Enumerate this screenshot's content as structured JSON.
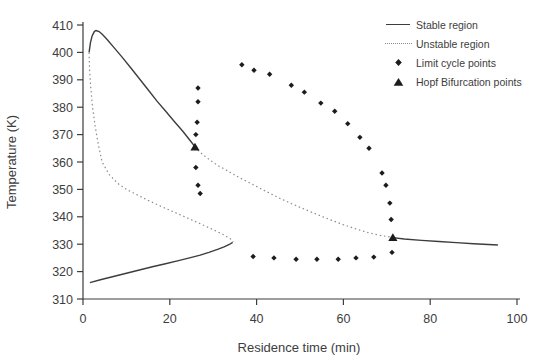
{
  "figure": {
    "background": "#ffffff",
    "ink_color": "#3d3d3d",
    "unstable_color": "#8c8c8c",
    "marker_color": "#1c1c1c"
  },
  "chart_data": {
    "type": "line",
    "title": "",
    "xlabel": "Residence time (min)",
    "ylabel": "Temperature (K)",
    "xlim": [
      0,
      100
    ],
    "ylim": [
      310,
      410
    ],
    "xticks": [
      0,
      20,
      40,
      60,
      80,
      100
    ],
    "yticks": [
      310,
      320,
      330,
      340,
      350,
      360,
      370,
      380,
      390,
      400,
      410
    ],
    "grid": false,
    "legend_position": "top-right",
    "series": [
      {
        "name": "Stable region",
        "type": "line",
        "style": "solid",
        "segments": [
          [
            [
              1.4,
              400
            ],
            [
              1.7,
              403.5
            ],
            [
              2.1,
              406
            ],
            [
              2.6,
              407.6
            ],
            [
              3,
              408
            ],
            [
              3.7,
              407.6
            ],
            [
              4.5,
              406.5
            ],
            [
              5.5,
              404.8
            ],
            [
              7,
              402
            ],
            [
              9,
              398.3
            ],
            [
              11,
              394.4
            ],
            [
              13,
              390.4
            ],
            [
              15,
              386.4
            ],
            [
              17,
              382.3
            ],
            [
              19,
              378.6
            ],
            [
              21,
              374.9
            ],
            [
              23,
              371.2
            ],
            [
              25,
              367.2
            ],
            [
              25.8,
              365.5
            ]
          ],
          [
            [
              1.6,
              316
            ],
            [
              4,
              317
            ],
            [
              7,
              318.2
            ],
            [
              10,
              319.4
            ],
            [
              13,
              320.6
            ],
            [
              16,
              321.8
            ],
            [
              19,
              322.9
            ],
            [
              22,
              324
            ],
            [
              25,
              325.2
            ],
            [
              27,
              326
            ],
            [
              29,
              327
            ],
            [
              31,
              328.1
            ],
            [
              32.5,
              329
            ],
            [
              33.7,
              329.9
            ],
            [
              34.5,
              330.7
            ]
          ],
          [
            [
              71.4,
              332.4
            ],
            [
              74,
              331.9
            ],
            [
              78,
              331.4
            ],
            [
              82,
              331
            ],
            [
              86,
              330.6
            ],
            [
              90,
              330.2
            ],
            [
              95.6,
              329.7
            ]
          ]
        ]
      },
      {
        "name": "Unstable region",
        "type": "line",
        "style": "dotted",
        "segments": [
          [
            [
              1.4,
              400
            ],
            [
              1.5,
              394
            ],
            [
              1.8,
              387
            ],
            [
              2.2,
              380
            ],
            [
              2.8,
              373
            ],
            [
              3.5,
              366.5
            ],
            [
              4.4,
              360
            ],
            [
              6,
              355.5
            ],
            [
              8,
              352.2
            ],
            [
              10,
              350
            ],
            [
              12.5,
              348
            ],
            [
              15,
              346
            ],
            [
              18,
              343.8
            ],
            [
              21,
              341.7
            ],
            [
              24,
              339.6
            ],
            [
              27,
              337.5
            ],
            [
              30,
              335.3
            ],
            [
              32.5,
              333.4
            ],
            [
              34,
              331.9
            ],
            [
              34.6,
              330.8
            ]
          ],
          [
            [
              25.8,
              365.5
            ],
            [
              27,
              363.5
            ],
            [
              29,
              361
            ],
            [
              31,
              358.8
            ],
            [
              33.5,
              356.6
            ],
            [
              36,
              354.3
            ],
            [
              39,
              351.9
            ],
            [
              42,
              349.4
            ],
            [
              45,
              347
            ],
            [
              48,
              344.8
            ],
            [
              51,
              342.8
            ],
            [
              54,
              340.8
            ],
            [
              57,
              338.9
            ],
            [
              60,
              337.1
            ],
            [
              63,
              335.5
            ],
            [
              66,
              334.1
            ],
            [
              68.5,
              333.2
            ],
            [
              70.5,
              332.7
            ],
            [
              71.4,
              332.4
            ]
          ]
        ]
      },
      {
        "name": "Limit cycle points",
        "type": "scatter",
        "marker": "diamond",
        "points": [
          [
            26.5,
            387
          ],
          [
            26.5,
            382
          ],
          [
            26.3,
            374.5
          ],
          [
            26,
            370
          ],
          [
            26,
            358
          ],
          [
            26.5,
            351.5
          ],
          [
            27,
            348.5
          ],
          [
            36.6,
            395.5
          ],
          [
            39.4,
            393.5
          ],
          [
            43,
            392
          ],
          [
            48,
            388
          ],
          [
            51,
            385.5
          ],
          [
            54.8,
            381.5
          ],
          [
            58,
            378.5
          ],
          [
            61,
            374
          ],
          [
            63.8,
            369
          ],
          [
            65.9,
            365
          ],
          [
            68.9,
            356
          ],
          [
            69.8,
            351.5
          ],
          [
            70.7,
            345
          ],
          [
            71,
            339
          ],
          [
            71.2,
            327
          ],
          [
            39.2,
            325.5
          ],
          [
            44,
            325
          ],
          [
            49.1,
            324.5
          ],
          [
            53.9,
            324.5
          ],
          [
            58.8,
            324.5
          ],
          [
            62.9,
            325
          ],
          [
            67,
            325.3
          ]
        ]
      },
      {
        "name": "Hopf Bifurcation points",
        "type": "scatter",
        "marker": "triangle",
        "points": [
          [
            25.8,
            365.5
          ],
          [
            71.4,
            332.5
          ]
        ]
      }
    ]
  }
}
